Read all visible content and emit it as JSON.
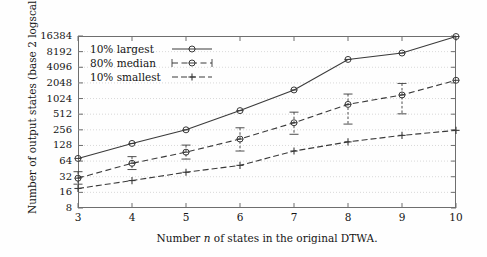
{
  "chart_data": {
    "type": "line",
    "title": "",
    "xlabel": "Number n of states in the original DTWA.",
    "ylabel": "Number of output states (base 2 logscale).",
    "x": [
      3,
      4,
      5,
      6,
      7,
      8,
      9,
      10
    ],
    "xtick_labels": [
      "3",
      "4",
      "5",
      "6",
      "7",
      "8",
      "9",
      "10"
    ],
    "xlim": [
      3,
      10
    ],
    "ytick_labels": [
      "16384",
      "8192",
      "4096",
      "2048",
      "1024",
      "512",
      "256",
      "128",
      "64",
      "32",
      "16",
      "8"
    ],
    "ytick_values": [
      16384,
      8192,
      4096,
      2048,
      1024,
      512,
      256,
      128,
      64,
      32,
      16,
      8
    ],
    "ylim": [
      8,
      16384
    ],
    "yscale": "log2",
    "grid": true,
    "legend_position": "upper-left-inside",
    "series": [
      {
        "name": "10% largest",
        "marker": "circle",
        "linestyle": "solid",
        "values": [
          72,
          140,
          256,
          600,
          1500,
          5800,
          7700,
          16000
        ],
        "err_low": [
          72,
          140,
          256,
          600,
          1500,
          5800,
          7700,
          16000
        ],
        "err_high": [
          72,
          140,
          256,
          600,
          1500,
          5800,
          7700,
          16000
        ]
      },
      {
        "name": "80% median",
        "marker": "circle",
        "linestyle": "dashed",
        "values": [
          30,
          58,
          95,
          170,
          350,
          790,
          1200,
          2300
        ],
        "err_low": [
          23,
          44,
          70,
          100,
          210,
          330,
          520,
          2300
        ],
        "err_high": [
          40,
          78,
          130,
          280,
          560,
          1250,
          2000,
          2300
        ]
      },
      {
        "name": "10% smallest",
        "marker": "plus",
        "linestyle": "dashdot",
        "values": [
          19,
          27,
          39,
          53,
          100,
          150,
          200,
          250
        ],
        "err_low": [
          19,
          27,
          39,
          53,
          100,
          150,
          200,
          250
        ],
        "err_high": [
          19,
          27,
          39,
          53,
          100,
          150,
          200,
          250
        ]
      }
    ],
    "legend_entries": [
      "10% largest",
      "80% median",
      "10% smallest"
    ]
  },
  "colors": {
    "axis": "#6e6e6e",
    "grid": "#c9c9c9",
    "series": "#3a3a3a",
    "text": "#141414",
    "background": "#fefefe"
  }
}
